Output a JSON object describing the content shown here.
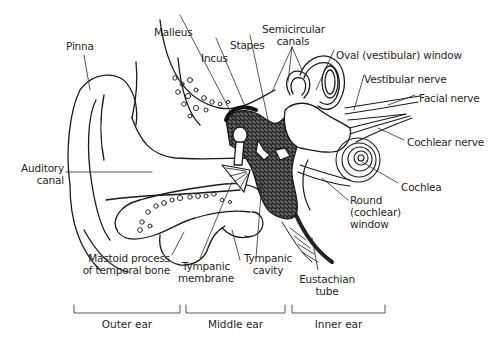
{
  "diagram": {
    "labels": {
      "pinna": "Pinna",
      "malleus": "Malleus",
      "incus": "Incus",
      "stapes": "Stapes",
      "semicircular_canals_1": "Semicircular",
      "semicircular_canals_2": "canals",
      "oval_window": "Oval (vestibular) window",
      "vestibular_nerve": "Vestibular nerve",
      "facial_nerve": "Facial nerve",
      "cochlear_nerve": "Cochlear nerve",
      "cochlea": "Cochlea",
      "round_window_1": "Round",
      "round_window_2": "(cochlear)",
      "round_window_3": "window",
      "auditory_canal_1": "Auditory",
      "auditory_canal_2": "canal",
      "mastoid_1": "Mastoid process",
      "mastoid_2": "of temporal bone",
      "tympanic_membrane_1": "Tympanic",
      "tympanic_membrane_2": "membrane",
      "tympanic_cavity_1": "Tympanic",
      "tympanic_cavity_2": "cavity",
      "eustachian_1": "Eustachian",
      "eustachian_2": "tube"
    },
    "regions": [
      {
        "label": "Outer ear"
      },
      {
        "label": "Middle ear"
      },
      {
        "label": "Inner ear"
      }
    ]
  }
}
